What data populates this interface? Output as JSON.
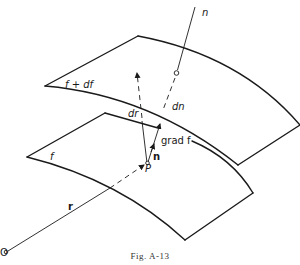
{
  "figure": {
    "caption": "Fig. A-13",
    "labels": {
      "normal": "n",
      "upper_surface": "f + df",
      "lower_surface": "f",
      "dn": "dn",
      "dr": "dr",
      "grad_f": "grad f",
      "unit_normal": "n",
      "point": "P",
      "position_vector": "r",
      "origin": "O"
    }
  }
}
